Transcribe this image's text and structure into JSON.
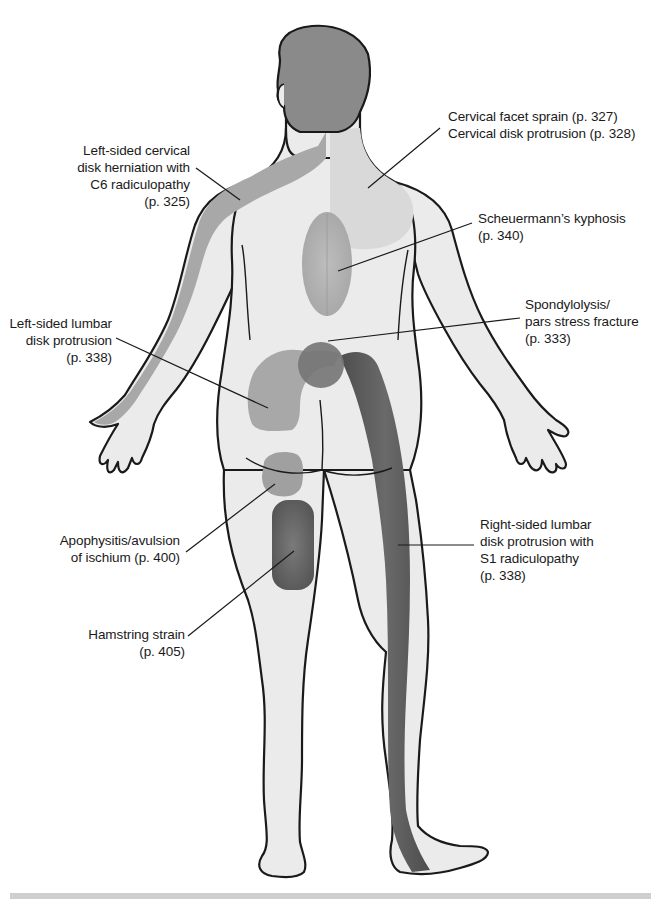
{
  "figure": {
    "view": "posterior body",
    "colors": {
      "background": "#ffffff",
      "skin": "#ebebeb",
      "outline": "#1a1a1a",
      "hair": "#8a8a8a",
      "light_zone": "#d9d9d9",
      "medium_zone": "#a8a8a8",
      "dark_zone": "#6e6e6e",
      "darker_zone": "#5a5a5a",
      "rule": "#cfcfcf"
    }
  },
  "labels": [
    {
      "id": "cervical-facet",
      "text": "Cervical facet sprain (p. 327)\nCervical disk protrusion (p. 328)",
      "align": "left",
      "x": 448,
      "y": 108
    },
    {
      "id": "left-cervical-herniation",
      "text": "Left-sided cervical\ndisk herniation with\nC6 radiculopathy\n(p. 325)",
      "align": "right",
      "x": 40,
      "y": 142,
      "w": 150
    },
    {
      "id": "scheuermann",
      "text": "Scheuermann’s kyphosis\n(p. 340)",
      "align": "left",
      "x": 478,
      "y": 210
    },
    {
      "id": "spondylolysis",
      "text": "Spondylolysis/\npars stress fracture\n(p. 333)",
      "align": "left",
      "x": 525,
      "y": 296
    },
    {
      "id": "left-lumbar",
      "text": "Left-sided lumbar\ndisk protrusion\n(p. 338)",
      "align": "right",
      "x": 0,
      "y": 315,
      "w": 112
    },
    {
      "id": "apophysitis",
      "text": "Apophysitis/avulsion\nof ischium (p. 400)",
      "align": "right",
      "x": 40,
      "y": 532,
      "w": 140
    },
    {
      "id": "hamstring",
      "text": "Hamstring strain\n(p. 405)",
      "align": "right",
      "x": 40,
      "y": 626,
      "w": 145
    },
    {
      "id": "right-lumbar-s1",
      "text": "Right-sided lumbar\ndisk protrusion with\nS1 radiculopathy\n(p. 338)",
      "align": "left",
      "x": 480,
      "y": 516
    }
  ],
  "leader_lines": [
    {
      "for": "cervical-facet",
      "x1": 440,
      "y1": 128,
      "x2": 368,
      "y2": 188
    },
    {
      "for": "left-cervical-herniation",
      "x1": 196,
      "y1": 168,
      "x2": 240,
      "y2": 200
    },
    {
      "for": "scheuermann",
      "x1": 472,
      "y1": 223,
      "x2": 338,
      "y2": 271
    },
    {
      "for": "spondylolysis",
      "x1": 520,
      "y1": 318,
      "x2": 328,
      "y2": 341
    },
    {
      "for": "left-lumbar",
      "x1": 116,
      "y1": 338,
      "x2": 268,
      "y2": 408
    },
    {
      "for": "apophysitis",
      "x1": 186,
      "y1": 552,
      "x2": 275,
      "y2": 484
    },
    {
      "for": "hamstring",
      "x1": 188,
      "y1": 636,
      "x2": 294,
      "y2": 551
    },
    {
      "for": "right-lumbar-s1",
      "x1": 474,
      "y1": 545,
      "x2": 398,
      "y2": 545
    }
  ],
  "regions": [
    {
      "id": "left-c6-dermatome",
      "shade": "medium_zone"
    },
    {
      "id": "cervical-zone",
      "shade": "light_zone"
    },
    {
      "id": "thoracic-kyphosis-oval",
      "shade": "medium_zone"
    },
    {
      "id": "lumbar-spondylolysis-circle",
      "shade": "dark_zone"
    },
    {
      "id": "left-lumbar-arc",
      "shade": "medium_zone"
    },
    {
      "id": "right-s1-dermatome",
      "shade": "darker_zone"
    },
    {
      "id": "ischium-blob",
      "shade": "medium_zone"
    },
    {
      "id": "hamstring-blob",
      "shade": "dark_zone"
    }
  ]
}
